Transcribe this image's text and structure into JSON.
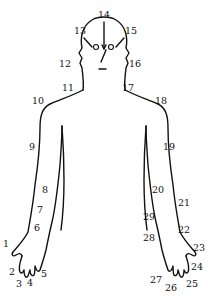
{
  "diagram": {
    "type": "body-outline-with-numbered-points",
    "line_color": "#111111",
    "background": "#ffffff",
    "points": [
      {
        "id": "1",
        "label": "1",
        "x": 3,
        "y": 247
      },
      {
        "id": "2",
        "label": "2",
        "x": 9,
        "y": 275
      },
      {
        "id": "3",
        "label": "3",
        "x": 16,
        "y": 287
      },
      {
        "id": "4",
        "label": "4",
        "x": 27,
        "y": 286
      },
      {
        "id": "5",
        "label": "5",
        "x": 41,
        "y": 277
      },
      {
        "id": "6",
        "label": "6",
        "x": 34,
        "y": 231
      },
      {
        "id": "7",
        "label": "7",
        "x": 37,
        "y": 213
      },
      {
        "id": "8",
        "label": "8",
        "x": 42,
        "y": 193
      },
      {
        "id": "9",
        "label": "9",
        "x": 29,
        "y": 150
      },
      {
        "id": "10",
        "label": "10",
        "x": 32,
        "y": 104
      },
      {
        "id": "11",
        "label": "11",
        "x": 62,
        "y": 91
      },
      {
        "id": "12",
        "label": "12",
        "x": 59,
        "y": 67
      },
      {
        "id": "13",
        "label": "13",
        "x": 74,
        "y": 34
      },
      {
        "id": "14",
        "label": "14",
        "x": 98,
        "y": 18
      },
      {
        "id": "15",
        "label": "15",
        "x": 125,
        "y": 34
      },
      {
        "id": "16",
        "label": "16",
        "x": 129,
        "y": 67
      },
      {
        "id": "17",
        "label": "17",
        "x": 122,
        "y": 91
      },
      {
        "id": "18",
        "label": "18",
        "x": 155,
        "y": 104
      },
      {
        "id": "19",
        "label": "19",
        "x": 163,
        "y": 150
      },
      {
        "id": "20",
        "label": "20",
        "x": 152,
        "y": 193
      },
      {
        "id": "21",
        "label": "21",
        "x": 178,
        "y": 206
      },
      {
        "id": "22",
        "label": "22",
        "x": 178,
        "y": 233
      },
      {
        "id": "23",
        "label": "23",
        "x": 193,
        "y": 251
      },
      {
        "id": "24",
        "label": "24",
        "x": 191,
        "y": 270
      },
      {
        "id": "25",
        "label": "25",
        "x": 186,
        "y": 287
      },
      {
        "id": "26",
        "label": "26",
        "x": 165,
        "y": 291
      },
      {
        "id": "27",
        "label": "27",
        "x": 150,
        "y": 283
      },
      {
        "id": "28",
        "label": "28",
        "x": 143,
        "y": 241
      },
      {
        "id": "29",
        "label": "29",
        "x": 143,
        "y": 220
      }
    ]
  }
}
